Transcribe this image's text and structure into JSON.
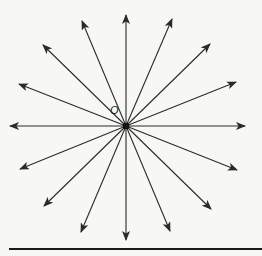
{
  "diagram": {
    "point_label": "O",
    "center": [
      126,
      126
    ],
    "colors": {
      "stroke": "#2a2a2a",
      "background": "#f7f7f5",
      "baseline": "#1a1a1a"
    },
    "ray_tips": [
      [
        126,
        15
      ],
      [
        172,
        19
      ],
      [
        210,
        44
      ],
      [
        236,
        82
      ],
      [
        245,
        126
      ],
      [
        237,
        170
      ],
      [
        211,
        209
      ],
      [
        170,
        231
      ],
      [
        126,
        240
      ],
      [
        81,
        232
      ],
      [
        44,
        206
      ],
      [
        20,
        169
      ],
      [
        10,
        126
      ],
      [
        19,
        84
      ],
      [
        43,
        45
      ],
      [
        82,
        21
      ]
    ],
    "baseline": {
      "x1": 9,
      "x2": 262,
      "y": 249
    }
  }
}
